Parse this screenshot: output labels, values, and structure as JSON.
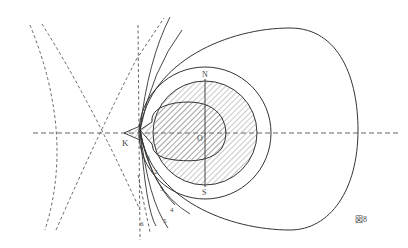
{
  "figure": {
    "caption": "図8",
    "labels": {
      "k": "K",
      "o": "O",
      "n": "N",
      "s": "S"
    },
    "curve_numbers": [
      "1",
      "2",
      "3",
      "4",
      "5",
      "6"
    ],
    "colors": {
      "line": "#333333",
      "dash": "#555555",
      "hatch": "#666666",
      "background": "#ffffff"
    }
  }
}
